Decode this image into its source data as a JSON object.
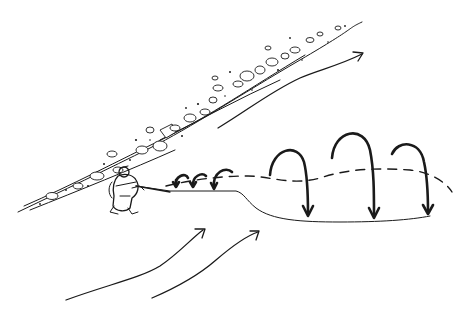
{
  "illustration": {
    "subject": "Angler on riverbank casting line across current, with mending loops",
    "background_color": "#ffffff",
    "ink_color": "#1a1a1a",
    "elements": {
      "riverbank": {
        "label": "rocky-riverbank"
      },
      "angler": {
        "label": "angler-figure"
      },
      "fly_line": {
        "label": "fly-line"
      },
      "drift_path": {
        "label": "dashed-drift-path"
      },
      "small_mends": {
        "count": 3
      },
      "large_mends": {
        "count": 3
      },
      "current_arrows": {
        "count": 3
      }
    }
  }
}
